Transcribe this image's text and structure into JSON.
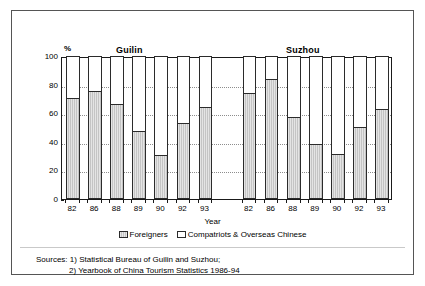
{
  "chart_data": {
    "type": "bar",
    "subtype": "100% stacked bar, two panel groups",
    "title": "",
    "xlabel": "Year",
    "ylabel": "%",
    "ylim": [
      0,
      100
    ],
    "yticks": [
      0,
      20,
      40,
      60,
      80,
      100
    ],
    "grid": "horizontal dotted gridlines at 20, 40, 60, 80",
    "legend_position": "bottom-center",
    "groups": [
      {
        "name": "Guilin",
        "categories": [
          "82",
          "86",
          "88",
          "89",
          "90",
          "92",
          "93"
        ]
      },
      {
        "name": "Suzhou",
        "categories": [
          "82",
          "86",
          "88",
          "89",
          "90",
          "92",
          "93"
        ]
      }
    ],
    "categories": [
      "82",
      "86",
      "88",
      "89",
      "90",
      "92",
      "93",
      "82",
      "86",
      "88",
      "89",
      "90",
      "92",
      "93"
    ],
    "series": [
      {
        "name": "Foreigners",
        "color": "#c4c4c4",
        "values": [
          70,
          74.5,
          65.5,
          47,
          30,
          52.5,
          63.5,
          73.5,
          83.5,
          57,
          37.5,
          31,
          50,
          62.5
        ]
      },
      {
        "name": "Compatriots & Overseas Chinese",
        "color": "#ffffff",
        "values": [
          30,
          25.5,
          34.5,
          53,
          70,
          47.5,
          36.5,
          26.5,
          16.5,
          43,
          62.5,
          69,
          50,
          37.5
        ]
      }
    ],
    "annotations": {
      "panel_labels": [
        "Guilin",
        "Suzhou"
      ]
    }
  },
  "legend": {
    "entries": [
      {
        "label": "Foreigners",
        "swatch": "filled"
      },
      {
        "label": "Compatriots & Overseas Chinese",
        "swatch": "empty"
      }
    ]
  },
  "sources": {
    "line1": "Sources: 1) Statistical Bureau of Guilin and Suzhou;",
    "line2": "2) Yearbook of China Tourism Statistics 1986-94"
  }
}
